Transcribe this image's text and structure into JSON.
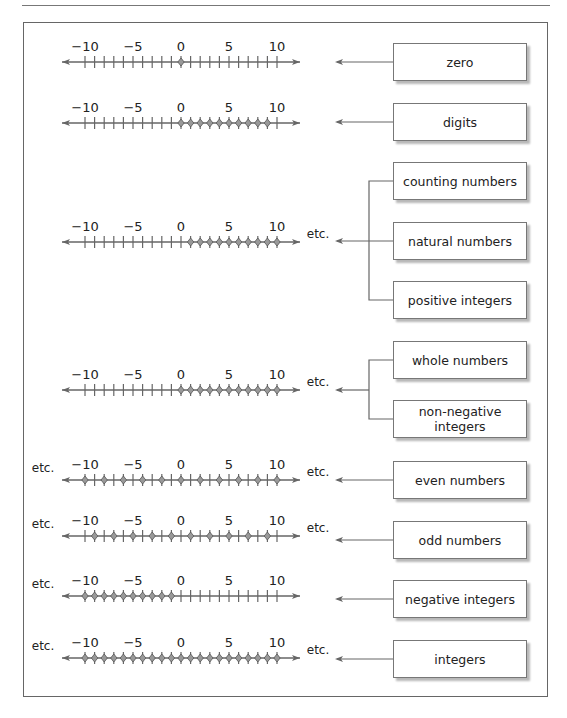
{
  "figure": {
    "tick_labels": [
      "−10",
      "−5",
      "0",
      "5",
      "10"
    ],
    "etc_label": "etc."
  },
  "boxes": {
    "zero": "zero",
    "digits": "digits",
    "counting": "counting numbers",
    "natural": "natural numbers",
    "positive": "positive integers",
    "whole": "whole numbers",
    "nonneg_1": "non-negative",
    "nonneg_2": "integers",
    "even": "even numbers",
    "odd": "odd numbers",
    "negative": "negative integers",
    "integers": "integers"
  },
  "chart_data": {
    "type": "number_lines",
    "axis_range": [
      -10,
      10
    ],
    "tick_step": 1,
    "labeled_ticks": [
      -10,
      -5,
      0,
      5,
      10
    ],
    "rows": [
      {
        "label": "zero",
        "points": [
          0
        ],
        "etc_left": false,
        "etc_right": false
      },
      {
        "label": "digits",
        "points": [
          0,
          1,
          2,
          3,
          4,
          5,
          6,
          7,
          8,
          9
        ],
        "etc_left": false,
        "etc_right": false
      },
      {
        "label": [
          "counting numbers",
          "natural numbers",
          "positive integers"
        ],
        "points": [
          1,
          2,
          3,
          4,
          5,
          6,
          7,
          8,
          9,
          10
        ],
        "etc_left": false,
        "etc_right": true
      },
      {
        "label": [
          "whole numbers",
          "non-negative integers"
        ],
        "points": [
          0,
          1,
          2,
          3,
          4,
          5,
          6,
          7,
          8,
          9,
          10
        ],
        "etc_left": false,
        "etc_right": true
      },
      {
        "label": "even numbers",
        "points": [
          -10,
          -8,
          -6,
          -4,
          -2,
          0,
          2,
          4,
          6,
          8,
          10
        ],
        "etc_left": true,
        "etc_right": true
      },
      {
        "label": "odd numbers",
        "points": [
          -9,
          -7,
          -5,
          -3,
          -1,
          1,
          3,
          5,
          7,
          9
        ],
        "etc_left": true,
        "etc_right": true
      },
      {
        "label": "negative integers",
        "points": [
          -10,
          -9,
          -8,
          -7,
          -6,
          -5,
          -4,
          -3,
          -2,
          -1
        ],
        "etc_left": true,
        "etc_right": false
      },
      {
        "label": "integers",
        "points": [
          -10,
          -9,
          -8,
          -7,
          -6,
          -5,
          -4,
          -3,
          -2,
          -1,
          0,
          1,
          2,
          3,
          4,
          5,
          6,
          7,
          8,
          9,
          10
        ],
        "etc_left": true,
        "etc_right": true
      }
    ]
  }
}
